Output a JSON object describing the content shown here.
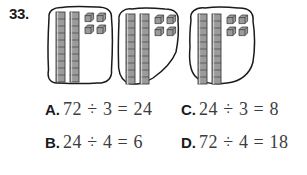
{
  "question": {
    "number": "33."
  },
  "figure": {
    "total_blocks": 72,
    "group_count": 3,
    "blocks_per_group": 24,
    "rods_per_group": 2,
    "cubes_per_rod": 10,
    "unit_cubes_per_group": 4,
    "block_fill_color": "#9a9a9a",
    "block_outline_color": "#4a4a4a",
    "bag_outline_color": "#1a1a1a",
    "groups": [
      {
        "name": "group-1",
        "rods": 2,
        "unit_cubes": 4,
        "value": 24
      },
      {
        "name": "group-2",
        "rods": 2,
        "unit_cubes": 4,
        "value": 24
      },
      {
        "name": "group-3",
        "rods": 2,
        "unit_cubes": 4,
        "value": 24
      }
    ]
  },
  "choices": {
    "a": {
      "label": "A.",
      "expression": "72 ÷ 3 = 24"
    },
    "b": {
      "label": "B.",
      "expression": "24 ÷ 4 = 6"
    },
    "c": {
      "label": "C.",
      "expression": "24 ÷ 3 = 8"
    },
    "d": {
      "label": "D.",
      "expression": "72 ÷ 4 = 18"
    }
  }
}
